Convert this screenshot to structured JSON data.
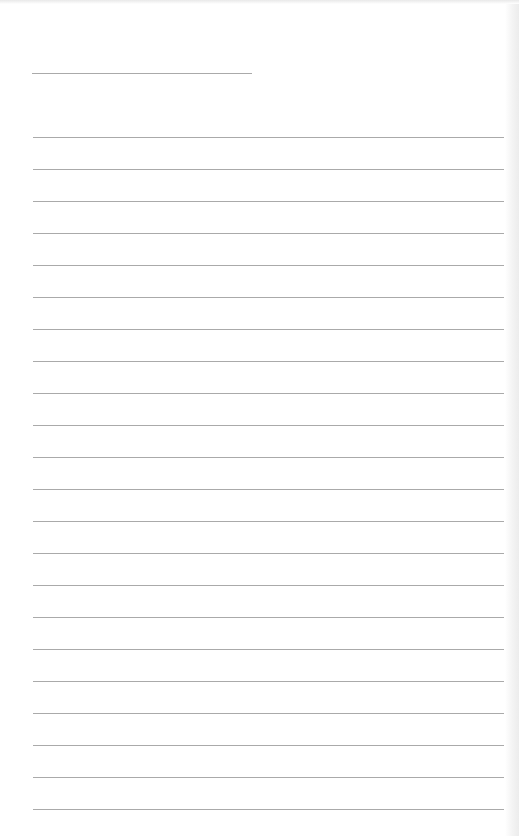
{
  "document": {
    "type": "lined-paper",
    "background_color": "#ffffff",
    "line_color": "#aaaaaa",
    "header_line": {
      "left": 32,
      "top": 73,
      "width": 220
    },
    "ruled_lines": {
      "count": 22,
      "first_top": 137,
      "spacing": 32,
      "left": 33,
      "width": 471
    }
  }
}
